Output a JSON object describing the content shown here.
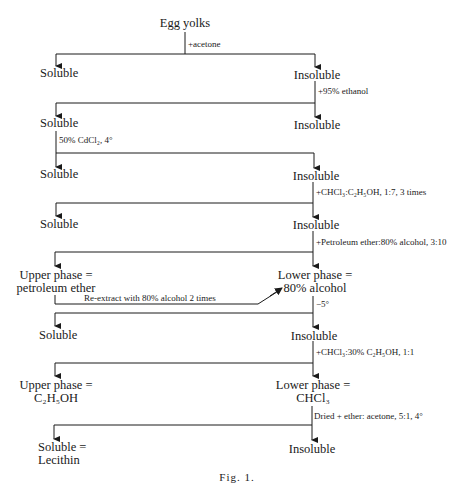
{
  "figure": {
    "caption": "Fig. 1.",
    "root": "Egg yolks",
    "steps": [
      {
        "reagent": "+acetone",
        "left": "Soluble",
        "right": "Insoluble"
      },
      {
        "reagent": "+95% ethanol",
        "left": "Soluble",
        "right": "Insoluble"
      },
      {
        "reagent": "50% CdCl₂, 4°",
        "left": "Soluble",
        "right": "Insoluble"
      },
      {
        "reagent": "+CHCl₃:C₂H₅OH, 1:7, 3 times",
        "left": "Soluble",
        "right": "Insoluble"
      },
      {
        "reagent": "+Petroleum ether:80% alcohol, 3:10",
        "left_line1": "Upper phase =",
        "left_line2": "petroleum ether",
        "right_line1": "Lower phase =",
        "right_line2": "80% alcohol"
      },
      {
        "reagent": "Re-extract with 80% alcohol 2 times"
      },
      {
        "reagent": "−5°",
        "left": "Soluble",
        "right": "Insoluble"
      },
      {
        "reagent": "+CHCl₃:30% C₂H₅OH, 1:1",
        "left_line1": "Upper phase =",
        "left_line2": "C₂H₅OH",
        "right_line1": "Lower phase =",
        "right_line2": "CHCl₃"
      },
      {
        "reagent": "Dried + ether: acetone, 5:1, 4°",
        "left_line1": "Soluble =",
        "left_line2": "Lecithin",
        "right": "Insoluble"
      }
    ]
  }
}
